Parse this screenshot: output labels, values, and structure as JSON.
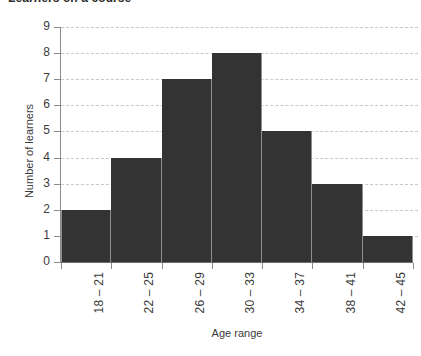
{
  "chart_data": {
    "type": "bar",
    "title": "Learners on a course",
    "xlabel": "Age range",
    "ylabel": "Number of learners",
    "categories": [
      "18 – 21",
      "22 – 25",
      "26 – 29",
      "30 – 33",
      "34 – 37",
      "38 – 41",
      "42 – 45"
    ],
    "values": [
      2,
      4,
      7,
      8,
      5,
      3,
      1
    ],
    "ylim": [
      0,
      9
    ],
    "y_ticks": [
      "0",
      "1",
      "2",
      "3",
      "4",
      "5",
      "6",
      "7",
      "8",
      "9"
    ],
    "grid": "horizontal-dashed",
    "legend": "none",
    "bar_color": "#333333",
    "gridline_color": "#c9c9c9",
    "axis_color": "#8a8a8a",
    "text_color": "#3b3b3b"
  }
}
